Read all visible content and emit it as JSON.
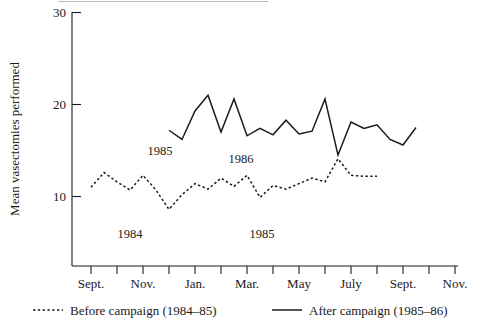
{
  "chart_data": {
    "type": "line",
    "title": "",
    "xlabel": "",
    "ylabel": "Mean vasectomies performed",
    "ylim": [
      5,
      30
    ],
    "yticks": [
      10,
      20,
      30
    ],
    "ytick_labels": [
      "10",
      "20",
      "30"
    ],
    "grid": false,
    "legend_position": "below-axis",
    "xtick_labels": [
      "Sept.",
      "Nov.",
      "Jan.",
      "Mar.",
      "May",
      "July",
      "Sept.",
      "Nov."
    ],
    "x_months": [
      "Sept.",
      "Oct.",
      "Nov.",
      "Dec.",
      "Jan.",
      "Feb.",
      "Mar.",
      "Apr.",
      "May",
      "June",
      "July",
      "Aug.",
      "Sept.",
      "Oct.",
      "Nov."
    ],
    "annotations": [
      {
        "text": "1985",
        "series": "after",
        "note": "start-of-series year marker"
      },
      {
        "text": "1986",
        "series": "after",
        "note": "calendar-year change marker"
      },
      {
        "text": "1984",
        "series": "before",
        "note": "start-of-series year marker"
      },
      {
        "text": "1985",
        "series": "before",
        "note": "calendar-year change marker"
      }
    ],
    "series": [
      {
        "name": "Before campaign (1984–85)",
        "style": "dashed",
        "color": "#1a1a1a",
        "start_month": "Sept.",
        "values": [
          11.0,
          12.6,
          11.6,
          10.7,
          12.3,
          10.7,
          8.6,
          10.2,
          11.4,
          10.8,
          12.0,
          11.1,
          12.3,
          9.9,
          11.2,
          10.8,
          11.4,
          12.0,
          11.6,
          14.1,
          12.3,
          12.2,
          12.2
        ]
      },
      {
        "name": "After campaign (1985–86)",
        "style": "solid",
        "color": "#1a1a1a",
        "start_month": "Dec.",
        "values": [
          17.2,
          16.2,
          19.3,
          21.0,
          17.0,
          20.6,
          16.6,
          17.4,
          16.7,
          18.3,
          16.8,
          17.1,
          20.6,
          14.5,
          18.1,
          17.4,
          17.8,
          16.2,
          15.6,
          17.5
        ]
      }
    ]
  },
  "axis": {
    "y_title": "Mean vasectomies performed",
    "y_tick_values": [
      "30",
      "20",
      "10"
    ],
    "x_tick_values": [
      "Sept.",
      "Nov.",
      "Jan.",
      "Mar.",
      "May",
      "July",
      "Sept.",
      "Nov."
    ]
  },
  "inline_annotations": {
    "after_1985": "1985",
    "after_1986": "1986",
    "before_1984": "1984",
    "before_1985": "1985"
  },
  "legend": {
    "before": "Before campaign (1984–85)",
    "after": "After campaign (1985–86)"
  },
  "colors": {
    "ink": "#1a1a1a",
    "background": "#ffffff"
  }
}
